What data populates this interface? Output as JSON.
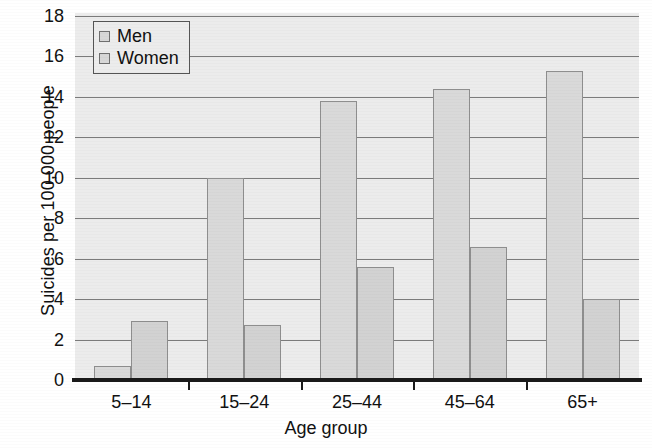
{
  "chart_data": {
    "type": "bar",
    "title": "",
    "subtitle": "",
    "xlabel": "Age group",
    "ylabel": "Suicides per 100,000 people",
    "categories": [
      "5–14",
      "15–24",
      "25–44",
      "45–64",
      "65+"
    ],
    "series": [
      {
        "name": "Men",
        "values": [
          0.7,
          10.0,
          13.8,
          14.4,
          15.3
        ]
      },
      {
        "name": "Women",
        "values": [
          2.9,
          2.7,
          5.6,
          6.6,
          4.0
        ]
      }
    ],
    "ylim": [
      0,
      18
    ],
    "yticks": [
      0,
      2,
      4,
      6,
      8,
      10,
      12,
      14,
      16,
      18
    ],
    "ytick_labels": [
      "0",
      "2",
      "4",
      "6",
      "8",
      "10",
      "12",
      "14",
      "16",
      "18"
    ],
    "grid": true,
    "grid_axis": "y",
    "legend_position": "top-left",
    "legend_entries": [
      "Men",
      "Women"
    ],
    "bar_style": {
      "fill": "#d9d9d9",
      "edge": "#8e8e8e",
      "plot_background": "#ececec",
      "grid_color": "#7b7b7b",
      "axis_color": "#1a1a1a",
      "text_color": "#111111"
    }
  },
  "axes": {
    "ylabel": "Suicides per 100,000 people",
    "xlabel": "Age group"
  },
  "legend": {
    "items": [
      {
        "label": "Men"
      },
      {
        "label": "Women"
      }
    ]
  }
}
